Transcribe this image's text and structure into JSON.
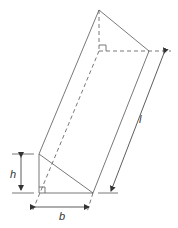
{
  "diagram": {
    "labels": {
      "height": "h",
      "base": "b",
      "length": "l"
    },
    "colors": {
      "stroke": "#444444",
      "background": "#ffffff"
    }
  }
}
